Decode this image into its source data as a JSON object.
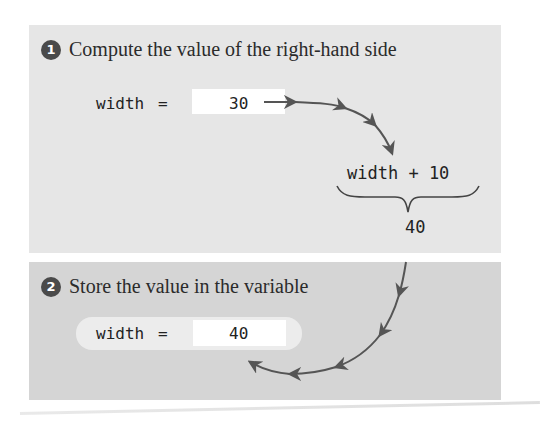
{
  "step1": {
    "badge": "1",
    "title": "Compute the value of the right-hand side",
    "variable": "width",
    "assign_op": "=",
    "current_value": "30",
    "expression": "width + 10",
    "result": "40"
  },
  "step2": {
    "badge": "2",
    "title": "Store the value in the variable",
    "variable": "width",
    "assign_op": "=",
    "new_value": "40"
  },
  "colors": {
    "panel1_bg": "#e6e6e6",
    "panel2_bg": "#d5d5d5",
    "badge_bg": "#4a4a4a",
    "arrow": "#555555",
    "value_box": "#ffffff"
  }
}
